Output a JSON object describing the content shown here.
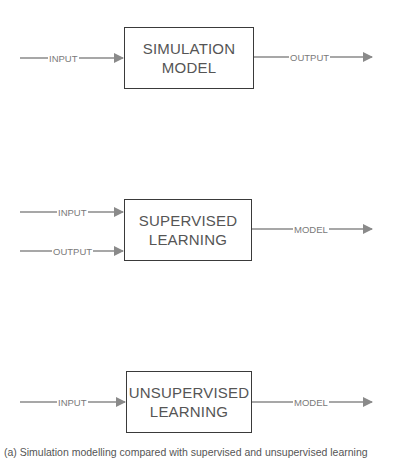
{
  "diagram": {
    "colors": {
      "line": "#8a8a8a",
      "box_border": "#3a3a3a",
      "box_text": "#555555",
      "label_text": "#7a7a7a"
    },
    "blocks": [
      {
        "id": "simulation",
        "title_line1": "SIMULATION",
        "title_line2": "MODEL",
        "inputs": [
          {
            "label": "INPUT"
          }
        ],
        "output": {
          "label": "OUTPUT"
        }
      },
      {
        "id": "supervised",
        "title_line1": "SUPERVISED",
        "title_line2": "LEARNING",
        "inputs": [
          {
            "label": "INPUT"
          },
          {
            "label": "OUTPUT"
          }
        ],
        "output": {
          "label": "MODEL"
        }
      },
      {
        "id": "unsupervised",
        "title_line1": "UNSUPERVISED",
        "title_line2": "LEARNING",
        "inputs": [
          {
            "label": "INPUT"
          }
        ],
        "output": {
          "label": "MODEL"
        }
      }
    ],
    "caption": "(a) Simulation modelling compared with supervised and unsupervised learning"
  }
}
